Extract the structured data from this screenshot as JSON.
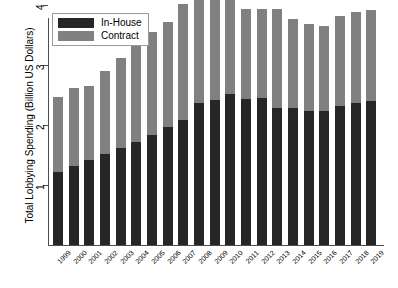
{
  "chart_data": {
    "type": "bar",
    "stacked": true,
    "title": "",
    "xlabel": "",
    "ylabel": "Total Lobbying Spending (Billion US Dollars)",
    "ylim": [
      0,
      4.4
    ],
    "yticks": [
      1,
      2,
      3,
      4
    ],
    "ytick_labels": [
      "1",
      "2",
      "3",
      "4"
    ],
    "grid": false,
    "legend_position": "top-left",
    "categories": [
      "1999",
      "2000",
      "2001",
      "2002",
      "2003",
      "2004",
      "2005",
      "2006",
      "2007",
      "2008",
      "2009",
      "2010",
      "2011",
      "2012",
      "2013",
      "2014",
      "2015",
      "2016",
      "2017",
      "2018",
      "2019"
    ],
    "series": [
      {
        "name": "In-House",
        "color": "#262626",
        "values": [
          1.21,
          1.32,
          1.42,
          1.52,
          1.62,
          1.71,
          1.83,
          1.97,
          2.09,
          2.36,
          2.41,
          2.52,
          2.44,
          2.45,
          2.29,
          2.28,
          2.24,
          2.24,
          2.31,
          2.36,
          2.4
        ]
      },
      {
        "name": "Contract",
        "color": "#808080",
        "values": [
          1.25,
          1.29,
          1.23,
          1.38,
          1.5,
          1.64,
          1.72,
          1.75,
          1.93,
          1.85,
          1.8,
          1.68,
          1.5,
          1.49,
          1.64,
          1.49,
          1.44,
          1.41,
          1.5,
          1.53,
          1.51
        ]
      }
    ],
    "totals": [
      2.46,
      2.61,
      2.65,
      2.9,
      3.12,
      3.35,
      3.55,
      3.72,
      4.02,
      4.21,
      4.21,
      4.2,
      3.94,
      3.94,
      3.93,
      3.77,
      3.68,
      3.65,
      3.81,
      3.89,
      3.91
    ]
  },
  "legend": {
    "items": [
      {
        "label": "In-House",
        "color": "#262626"
      },
      {
        "label": "Contract",
        "color": "#808080"
      }
    ]
  },
  "axes": {
    "y_title": "Total Lobbying Spending (Billion US Dollars)"
  }
}
